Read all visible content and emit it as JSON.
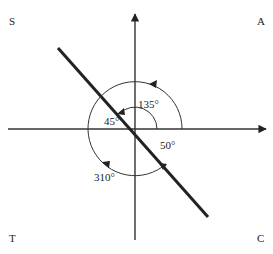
{
  "quadrants": {
    "top_left": "S",
    "top_right": "A",
    "bottom_left": "T",
    "bottom_right": "C"
  },
  "angles": {
    "inner_arc": "135°",
    "reference": "45°",
    "lower_right": "50°",
    "outer_arc": "310°"
  },
  "colors": {
    "ink": "#222222",
    "background": "#ffffff"
  }
}
